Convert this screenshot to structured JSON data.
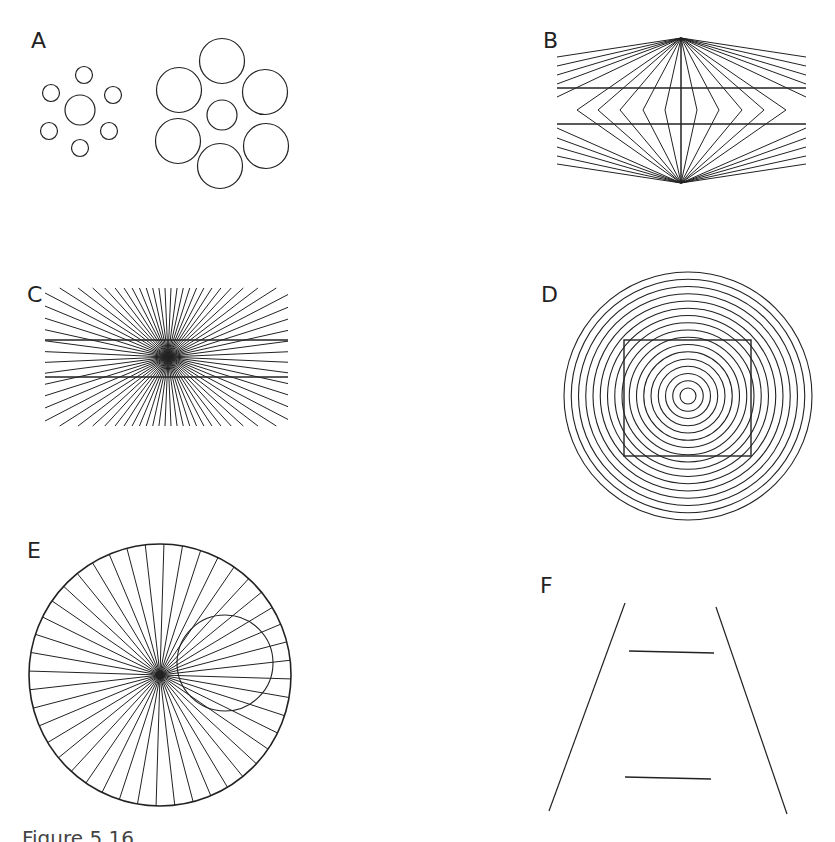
{
  "figure": {
    "caption": "Figure 5.16",
    "stroke_color": "#222222",
    "background": "#ffffff"
  },
  "panels": [
    {
      "id": "A",
      "label": "A",
      "description": "Ebbinghaus illusion: central circle surrounded by small circles vs. same circle surrounded by large circles"
    },
    {
      "id": "B",
      "label": "B",
      "description": "Wundt/Hering-type illusion: two horizontal lines crossed by lines converging to top and bottom apices"
    },
    {
      "id": "C",
      "label": "C",
      "description": "Hering illusion: two horizontal lines over a radiating fan of lines"
    },
    {
      "id": "D",
      "label": "D",
      "description": "Square superimposed on concentric circles"
    },
    {
      "id": "E",
      "label": "E",
      "description": "Circle superimposed on radiating spokes inside a large circle"
    },
    {
      "id": "F",
      "label": "F",
      "description": "Ponzo illusion: two equal horizontal lines between converging lines"
    }
  ],
  "geometry": {
    "A": {
      "left": {
        "center": [
          80,
          110
        ],
        "center_r": 15,
        "ring_r": 6,
        "ring_dist": 30,
        "count": 6
      },
      "right": {
        "center": [
          222,
          115
        ],
        "center_r": 15,
        "ring_r": 22,
        "ring_dist": 52,
        "count": 6
      }
    },
    "B": {
      "top": [
        681,
        38
      ],
      "bottom": [
        681,
        183
      ],
      "h_lines_y": [
        88,
        124
      ],
      "x_range": [
        557,
        806
      ]
    },
    "C": {
      "center": [
        168,
        357
      ],
      "h_lines_y": [
        340,
        377
      ],
      "x_range": [
        45,
        288
      ],
      "spokes": 36
    },
    "D": {
      "center": [
        688,
        396
      ],
      "rings": 17,
      "max_r": 124,
      "min_r": 8,
      "square": [
        624,
        340,
        751,
        456
      ]
    },
    "E": {
      "center": [
        160,
        675
      ],
      "r": 131,
      "spokes": 44,
      "small_circle": {
        "c": [
          225,
          663
        ],
        "r": 48
      }
    },
    "F": {
      "left_line": [
        [
          625,
          603
        ],
        [
          549,
          811
        ]
      ],
      "right_line": [
        [
          716,
          607
        ],
        [
          787,
          814
        ]
      ],
      "h_lines": [
        [
          [
            629,
            651
          ],
          [
            714,
            653
          ]
        ],
        [
          [
            625,
            777
          ],
          [
            711,
            779
          ]
        ]
      ]
    }
  }
}
